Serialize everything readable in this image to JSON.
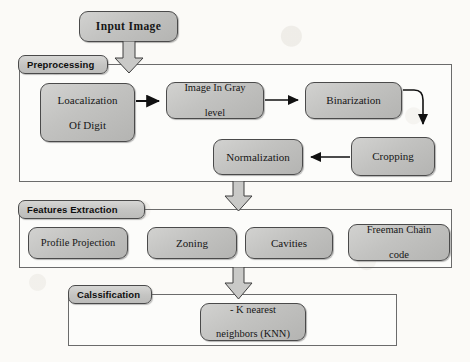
{
  "diagram": {
    "palette": {
      "node_fill": "#c4c4c2",
      "node_stroke": "#4a4a4a",
      "container_stroke": "#6b6b6b",
      "tab_fill": "#cbcbc9",
      "arrow_color": "#1a1a1a",
      "page_bg": "#fbfaf7"
    }
  },
  "input": {
    "label": "Input Image"
  },
  "preprocessing": {
    "tab_label": "Preprocessing",
    "nodes": [
      {
        "id": "localization",
        "label": "Loacalization\nOf Digit",
        "line1": "Loacalization",
        "line2": "Of Digit"
      },
      {
        "id": "gray",
        "label": "Image  In Gray\nlevel",
        "line1": "Image  In Gray",
        "line2": "level"
      },
      {
        "id": "binarization",
        "label": "Binarization",
        "line1": "Binarization",
        "line2": ""
      },
      {
        "id": "cropping",
        "label": "Cropping",
        "line1": "Cropping",
        "line2": ""
      },
      {
        "id": "normalization",
        "label": "Normalization",
        "line1": "Normalization",
        "line2": ""
      }
    ]
  },
  "features_extraction": {
    "tab_label": "Features Extraction",
    "nodes": [
      {
        "id": "profile-projection",
        "label": "Profile Projection",
        "line1": "Profile Projection",
        "line2": ""
      },
      {
        "id": "zoning",
        "label": "Zoning",
        "line1": "Zoning",
        "line2": ""
      },
      {
        "id": "cavities",
        "label": "Cavities",
        "line1": "Cavities",
        "line2": ""
      },
      {
        "id": "freeman-chain-code",
        "label": "Freeman  Chain\ncode",
        "line1": "Freeman  Chain",
        "line2": "code"
      }
    ]
  },
  "classification": {
    "tab_label": "Calssification",
    "nodes": [
      {
        "id": "knn",
        "label": "- K nearest\nneighbors (KNN)",
        "line1": "- K nearest",
        "line2": "neighbors (KNN)"
      }
    ]
  },
  "flow": {
    "block_arrows": [
      {
        "id": "input-to-preprocessing",
        "from": "Input Image",
        "to": "Preprocessing"
      },
      {
        "id": "preprocessing-to-features",
        "from": "Preprocessing",
        "to": "Features Extraction"
      },
      {
        "id": "features-to-classification",
        "from": "Features Extraction",
        "to": "Calssification"
      }
    ],
    "connectors": [
      {
        "id": "localization-to-gray",
        "from": "Loacalization Of Digit",
        "to": "Image In Gray level"
      },
      {
        "id": "gray-to-binarization",
        "from": "Image In Gray level",
        "to": "Binarization"
      },
      {
        "id": "binarization-to-cropping",
        "from": "Binarization",
        "to": "Cropping"
      },
      {
        "id": "cropping-to-normalization",
        "from": "Cropping",
        "to": "Normalization"
      }
    ]
  }
}
